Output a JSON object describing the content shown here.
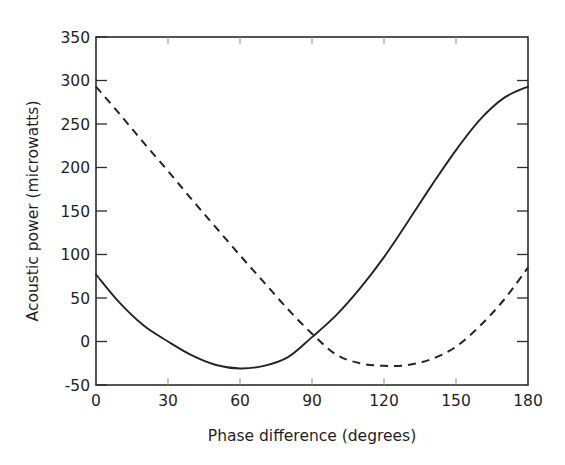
{
  "chart_data": {
    "type": "line",
    "title": "",
    "xlabel": "Phase difference (degrees)",
    "ylabel": "Acoustic power (microwatts)",
    "xlim": [
      0,
      180
    ],
    "ylim": [
      -50,
      350
    ],
    "xticks": [
      0,
      30,
      60,
      90,
      120,
      150,
      180
    ],
    "xticklabels": [
      "0",
      "30",
      "60",
      "90",
      "120",
      "150",
      "180"
    ],
    "yticks": [
      -50,
      0,
      50,
      100,
      150,
      200,
      250,
      300,
      350
    ],
    "yticklabels": [
      "-50",
      "0",
      "50",
      "100",
      "150",
      "200",
      "250",
      "300",
      "350"
    ],
    "grid": false,
    "legend": "none",
    "frame": "box",
    "series": [
      {
        "name": "solid-curve",
        "style": "solid",
        "color": "#242424",
        "x": [
          0,
          10,
          20,
          30,
          40,
          50,
          60,
          70,
          80,
          90,
          100,
          110,
          120,
          130,
          140,
          150,
          160,
          170,
          180
        ],
        "y": [
          77,
          44,
          18,
          0,
          -16,
          -27,
          -31,
          -28,
          -18,
          5,
          30,
          61,
          97,
          138,
          180,
          220,
          255,
          280,
          293
        ],
        "minimum": {
          "x": 60,
          "y": -31
        },
        "endpoints": {
          "left": {
            "x": 0,
            "y": 77
          },
          "right": {
            "x": 180,
            "y": 293
          }
        }
      },
      {
        "name": "dashed-curve",
        "style": "dashed",
        "color": "#242424",
        "x": [
          0,
          10,
          20,
          30,
          40,
          50,
          60,
          70,
          80,
          90,
          100,
          110,
          120,
          130,
          140,
          150,
          160,
          170,
          180
        ],
        "y": [
          293,
          261,
          228,
          196,
          163,
          131,
          99,
          68,
          37,
          9,
          -15,
          -25,
          -28,
          -27,
          -20,
          -6,
          18,
          48,
          85
        ],
        "minimum": {
          "x": 122,
          "y": -28
        },
        "endpoints": {
          "left": {
            "x": 0,
            "y": 293
          },
          "right": {
            "x": 180,
            "y": 85
          }
        }
      }
    ],
    "annotations": {
      "intersection": {
        "x": 90,
        "y": 7
      }
    }
  }
}
